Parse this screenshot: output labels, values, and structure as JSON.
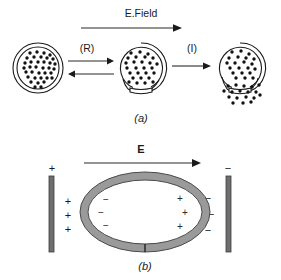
{
  "figure": {
    "panel_a": {
      "caption": "(a)",
      "field_label": "E.Field",
      "step_labels": {
        "reversible": "(R)",
        "irreversible": "(I)"
      },
      "vesicles": [
        {
          "name": "intact-vesicle",
          "state": "intact",
          "pore": false,
          "leaking": false,
          "cx": 38,
          "cy": 68,
          "r_outer": 25,
          "r_inner": 21,
          "dots": [
            [
              30,
              53
            ],
            [
              37,
              52
            ],
            [
              44,
              53
            ],
            [
              50,
              55
            ],
            [
              27,
              58
            ],
            [
              34,
              57
            ],
            [
              41,
              57
            ],
            [
              47,
              58
            ],
            [
              53,
              59
            ],
            [
              25,
              63
            ],
            [
              31,
              62
            ],
            [
              38,
              62
            ],
            [
              44,
              62
            ],
            [
              50,
              63
            ],
            [
              55,
              64
            ],
            [
              24,
              68
            ],
            [
              30,
              67
            ],
            [
              36,
              67
            ],
            [
              43,
              68
            ],
            [
              49,
              68
            ],
            [
              54,
              69
            ],
            [
              26,
              72
            ],
            [
              32,
              72
            ],
            [
              39,
              73
            ],
            [
              45,
              73
            ],
            [
              51,
              73
            ],
            [
              28,
              77
            ],
            [
              35,
              78
            ],
            [
              41,
              78
            ],
            [
              47,
              78
            ],
            [
              31,
              82
            ],
            [
              38,
              83
            ],
            [
              44,
              82
            ],
            [
              35,
              87
            ],
            [
              41,
              87
            ],
            [
              26,
              67
            ],
            [
              52,
              78
            ],
            [
              47,
              84
            ]
          ]
        },
        {
          "name": "pored-vesicle",
          "state": "pore-open",
          "pore": true,
          "leaking": false,
          "cx": 141,
          "cy": 68,
          "r_outer": 25,
          "r_inner": 21,
          "dots": [
            [
              131,
              53
            ],
            [
              140,
              52
            ],
            [
              148,
              54
            ],
            [
              128,
              58
            ],
            [
              136,
              57
            ],
            [
              145,
              57
            ],
            [
              153,
              58
            ],
            [
              126,
              63
            ],
            [
              134,
              62
            ],
            [
              142,
              62
            ],
            [
              150,
              63
            ],
            [
              157,
              64
            ],
            [
              127,
              68
            ],
            [
              136,
              68
            ],
            [
              144,
              68
            ],
            [
              152,
              68
            ],
            [
              130,
              73
            ],
            [
              138,
              73
            ],
            [
              146,
              73
            ],
            [
              154,
              73
            ],
            [
              133,
              78
            ],
            [
              141,
              78
            ],
            [
              149,
              78
            ],
            [
              137,
              83
            ],
            [
              145,
              83
            ],
            [
              153,
              82
            ],
            [
              129,
              82
            ]
          ]
        },
        {
          "name": "leaking-vesicle",
          "state": "leaking",
          "pore": true,
          "leaking": true,
          "cx": 240,
          "cy": 68,
          "r_outer": 25,
          "r_inner": 21,
          "dots": [
            [
              232,
              52
            ],
            [
              241,
              51
            ],
            [
              249,
              54
            ],
            [
              229,
              58
            ],
            [
              238,
              57
            ],
            [
              246,
              58
            ],
            [
              254,
              59
            ],
            [
              227,
              63
            ],
            [
              235,
              63
            ],
            [
              244,
              62
            ],
            [
              252,
              64
            ],
            [
              230,
              68
            ],
            [
              239,
              68
            ],
            [
              248,
              68
            ],
            [
              255,
              69
            ],
            [
              233,
              73
            ],
            [
              242,
              73
            ],
            [
              250,
              73
            ],
            [
              236,
              78
            ],
            [
              245,
              78
            ],
            [
              253,
              78
            ]
          ],
          "escaped_dots": [
            [
              228,
              86
            ],
            [
              236,
              85
            ],
            [
              244,
              86
            ],
            [
              252,
              87
            ],
            [
              259,
              85
            ],
            [
              224,
              91
            ],
            [
              232,
              92
            ],
            [
              240,
              91
            ],
            [
              248,
              92
            ],
            [
              256,
              92
            ],
            [
              229,
              97
            ],
            [
              237,
              98
            ],
            [
              246,
              97
            ],
            [
              254,
              98
            ],
            [
              233,
              103
            ],
            [
              243,
              103
            ],
            [
              251,
              102
            ],
            [
              260,
              95
            ]
          ]
        }
      ]
    },
    "panel_b": {
      "caption": "(b)",
      "field_label": "E",
      "electrodes": [
        {
          "name": "anode",
          "sign": "+",
          "x": 52,
          "y_top": 176,
          "y_bottom": 252
        },
        {
          "name": "cathode",
          "sign": "−",
          "x": 228,
          "y_top": 176,
          "y_bottom": 252
        }
      ],
      "outside_charges_left": [
        "+",
        "+",
        "+"
      ],
      "outside_charges_right": [
        "−",
        "−",
        "−"
      ],
      "inside_charges_left": [
        "−",
        "−",
        "−"
      ],
      "inside_charges_right": [
        "+",
        "+",
        "+"
      ],
      "cell": {
        "name": "cell-membrane-ring",
        "cx": 145,
        "cy": 212,
        "rx": 65,
        "ry": 40,
        "band": 8
      }
    }
  },
  "colors": {
    "background": "#ffffff",
    "ink": "#1a1a1a",
    "membrane_fill": "#9a9a9a",
    "membrane_stroke": "#4a4a4a",
    "electrode_fill": "#6e6e6e",
    "electrode_stroke": "#3c3c3c",
    "arrow": "#2a2a2a",
    "dot": "#111111"
  }
}
